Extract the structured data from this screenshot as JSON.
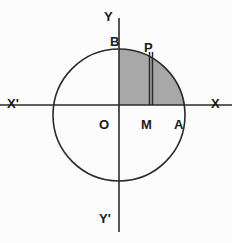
{
  "figure": {
    "background_color": "#fcfcfc",
    "stroke_color": "#2b2b2b",
    "shade_color": "#a8a8a8",
    "geometry": {
      "center": {
        "x": 119,
        "y": 115
      },
      "radius": 66,
      "x_axis": {
        "y": 105,
        "x_start": 0,
        "x_end": 232
      },
      "y_axis": {
        "x": 119,
        "y_start": 18,
        "y_end": 232
      },
      "shaded_region": {
        "description": "quarter disc between Y-axis and point A above the X-axis",
        "x_from": 119,
        "x_to": 185,
        "y_top": 49,
        "y_bottom": 105
      },
      "ordinate_line": {
        "description": "double vertical segment from M on the X-axis up to P on the circle",
        "x": 151,
        "y_top": 52,
        "y_bottom": 105
      },
      "points": {
        "O": {
          "x": 119,
          "y": 105
        },
        "A": {
          "x": 185,
          "y": 105
        },
        "B": {
          "x": 119,
          "y": 49
        },
        "M": {
          "x": 151,
          "y": 105
        },
        "P": {
          "x": 151,
          "y": 52
        }
      }
    },
    "labels": {
      "y_axis_positive": "Y",
      "y_axis_negative": "Y'",
      "x_axis_positive": "X",
      "x_axis_negative": "X'",
      "origin": "O",
      "point_a": "A",
      "point_b": "B",
      "point_m": "M",
      "point_p": "P"
    }
  }
}
